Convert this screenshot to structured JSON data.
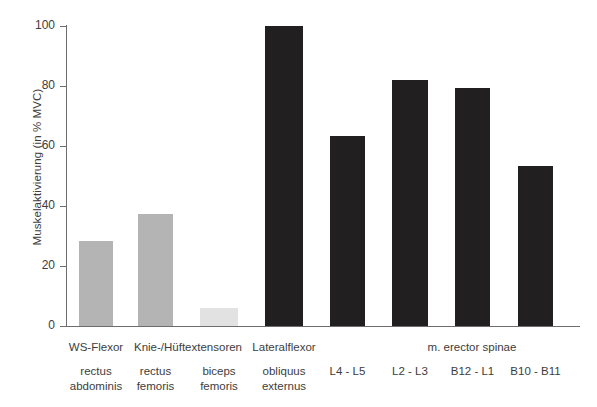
{
  "chart_data": {
    "type": "bar",
    "title": "",
    "xlabel": "",
    "ylabel": "Muskelaktivierung (in % MVC)",
    "ylim": [
      0,
      100
    ],
    "ytick_values": [
      0,
      20,
      40,
      60,
      80,
      100
    ],
    "ytick_labels": [
      "0",
      "20",
      "40",
      "60",
      "80",
      "100"
    ],
    "grid": false,
    "legend": false,
    "categories": [
      "rectus abdominis",
      "rectus femoris",
      "biceps femoris",
      "obliquus externus",
      "L4 - L5",
      "L2 - L3",
      "B12 - L1",
      "B10 - B11"
    ],
    "values": [
      28.5,
      37.5,
      6,
      100,
      63.5,
      82,
      79.5,
      53.5
    ],
    "bar_colors": [
      "#b4b4b4",
      "#b4b4b4",
      "#e2e2e2",
      "#211f1f",
      "#211f1f",
      "#211f1f",
      "#211f1f",
      "#211f1f"
    ],
    "bars": [
      {
        "label_line1": "rectus",
        "label_line2": "abdominis",
        "value": 28.5,
        "color": "#b4b4b4",
        "x": 79,
        "width": 34
      },
      {
        "label_line1": "rectus",
        "label_line2": "femoris",
        "value": 37.5,
        "color": "#b4b4b4",
        "x": 138,
        "width": 35
      },
      {
        "label_line1": "biceps",
        "label_line2": "femoris",
        "value": 6,
        "color": "#e2e2e2",
        "x": 200,
        "width": 38
      },
      {
        "label_line1": "obliquus",
        "label_line2": "externus",
        "value": 100,
        "color": "#211f1f",
        "x": 265,
        "width": 38
      },
      {
        "label_line1": "L4 - L5",
        "label_line2": "",
        "value": 63.5,
        "color": "#211f1f",
        "x": 330,
        "width": 35
      },
      {
        "label_line1": "L2 - L3",
        "label_line2": "",
        "value": 82,
        "color": "#211f1f",
        "x": 392,
        "width": 36
      },
      {
        "label_line1": "B12 - L1",
        "label_line2": "",
        "value": 79.5,
        "color": "#211f1f",
        "x": 455,
        "width": 35
      },
      {
        "label_line1": "B10 - B11",
        "label_line2": "",
        "value": 53.5,
        "color": "#211f1f",
        "x": 518,
        "width": 35
      }
    ],
    "groups": [
      {
        "label": "WS-Flexor",
        "center": 96,
        "span": 100
      },
      {
        "label": "Knie-/Hüftextensoren",
        "center": 188,
        "span": 160
      },
      {
        "label": "Lateralflexor",
        "center": 284,
        "span": 110
      },
      {
        "label": "m. erector spinae",
        "center": 472,
        "span": 240
      }
    ],
    "annotations": []
  }
}
